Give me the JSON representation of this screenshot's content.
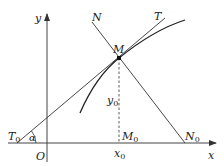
{
  "diagram": {
    "axes": {
      "x_label": "x",
      "y_label": "y",
      "origin_label": "O"
    },
    "points": {
      "M": {
        "label": "M"
      },
      "M0": {
        "label": "M",
        "sub": "0"
      },
      "N0": {
        "label": "N",
        "sub": "0"
      },
      "T0": {
        "label": "T",
        "sub": "0"
      }
    },
    "lines": {
      "tangent": {
        "label": "T"
      },
      "normal": {
        "label": "N"
      }
    },
    "annotations": {
      "x0": {
        "label": "x",
        "sub": "0"
      },
      "y0": {
        "label": "y",
        "sub": "0"
      },
      "angle": {
        "label": "α"
      }
    },
    "colors": {
      "stroke": "#333333",
      "text": "#222222"
    }
  }
}
